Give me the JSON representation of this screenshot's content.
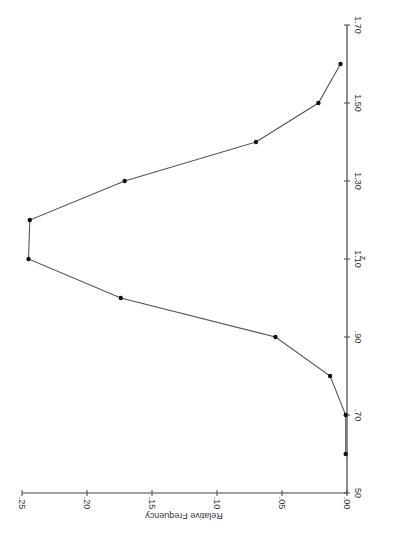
{
  "chart_data": {
    "type": "line",
    "orientation": "rotated 90 degrees clockwise (z axis vertical on right, relative frequency horizontal along bottom)",
    "title": "",
    "xlabel": "z",
    "ylabel": "Relative Frequency",
    "x": [
      0.6,
      0.7,
      0.8,
      0.9,
      1.0,
      1.1,
      1.2,
      1.3,
      1.4,
      1.5,
      1.6
    ],
    "series": [
      {
        "name": "Relative Frequency",
        "values": [
          0.001,
          0.001,
          0.013,
          0.055,
          0.174,
          0.245,
          0.244,
          0.171,
          0.07,
          0.022,
          0.005
        ]
      }
    ],
    "xlim": [
      0.5,
      1.7
    ],
    "ylim": [
      0.0,
      0.25
    ],
    "x_ticks": [
      "50",
      ".70",
      ".90",
      "1.10",
      "1.30",
      "1.50",
      "1.70"
    ],
    "y_ticks": [
      ".00",
      ".05",
      ".10",
      ".15",
      ".20",
      ".25"
    ],
    "grid": false,
    "legend": null,
    "markers": true
  },
  "labels": {
    "z_axis": "z",
    "freq_axis": "Relative Frequency",
    "z_ticks": [
      {
        "label": "50",
        "value": 0.5
      },
      {
        "label": ".70",
        "value": 0.7
      },
      {
        "label": ".90",
        "value": 0.9
      },
      {
        "label": "1.10",
        "value": 1.1
      },
      {
        "label": "1.30",
        "value": 1.3
      },
      {
        "label": "1.50",
        "value": 1.5
      },
      {
        "label": "1.70",
        "value": 1.7
      }
    ],
    "freq_ticks": [
      {
        "label": ".00",
        "value": 0.0
      },
      {
        "label": ".05",
        "value": 0.05
      },
      {
        "label": ".10",
        "value": 0.1
      },
      {
        "label": ".15",
        "value": 0.15
      },
      {
        "label": ".20",
        "value": 0.2
      },
      {
        "label": ".25",
        "value": 0.25
      }
    ]
  }
}
